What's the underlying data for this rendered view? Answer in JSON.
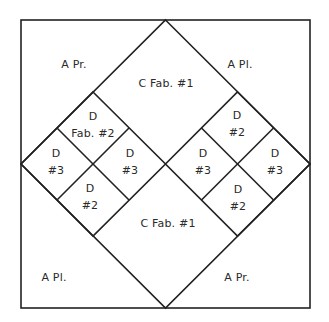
{
  "diagram": {
    "type": "quilt-block-pattern",
    "colors": {
      "line": "#222222",
      "text": "#2a2a2a",
      "background": "#ffffff"
    },
    "corner_labels": {
      "top_left": "A   Pr.",
      "top_right": "A   Pl.",
      "bottom_left": "A   Pl.",
      "bottom_right": "A   Pr."
    },
    "center_labels": {
      "top": "C   Fab. #1",
      "bottom": "C   Fab. #1"
    },
    "left_cluster": {
      "top": {
        "line1": "D",
        "line2": "Fab. #2"
      },
      "left": {
        "line1": "D",
        "line2": "#3"
      },
      "right": {
        "line1": "D",
        "line2": "#3"
      },
      "bottom": {
        "line1": "D",
        "line2": "#2"
      }
    },
    "right_cluster": {
      "top": {
        "line1": "D",
        "line2": "#2"
      },
      "left": {
        "line1": "D",
        "line2": "#3"
      },
      "right": {
        "line1": "D",
        "line2": "#3"
      },
      "bottom": {
        "line1": "D",
        "line2": "#2"
      }
    }
  }
}
